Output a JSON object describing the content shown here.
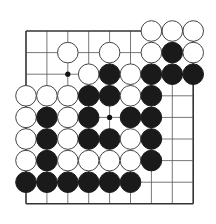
{
  "board": {
    "cols": 9,
    "rows": 9,
    "origin_x": 26,
    "origin_y": 31,
    "spacing_x": 20.9,
    "spacing_y": 21.6,
    "stone_radius": 10.3,
    "colors": {
      "line": "#555555",
      "edge": "#333333",
      "black_stone": "#1a1a1a",
      "white_stone": "#ffffff",
      "white_outline": "#444444",
      "background": "#ffffff"
    },
    "hoshi": [
      [
        2,
        2
      ],
      [
        4,
        4
      ]
    ],
    "stones": [
      {
        "c": 6,
        "r": 0,
        "color": "white"
      },
      {
        "c": 7,
        "r": 0,
        "color": "white"
      },
      {
        "c": 8,
        "r": 0,
        "color": "white"
      },
      {
        "c": 2,
        "r": 1,
        "color": "white"
      },
      {
        "c": 4,
        "r": 1,
        "color": "white"
      },
      {
        "c": 6,
        "r": 1,
        "color": "white"
      },
      {
        "c": 7,
        "r": 1,
        "color": "black"
      },
      {
        "c": 8,
        "r": 1,
        "color": "white"
      },
      {
        "c": 3,
        "r": 2,
        "color": "white"
      },
      {
        "c": 4,
        "r": 2,
        "color": "black"
      },
      {
        "c": 5,
        "r": 2,
        "color": "white"
      },
      {
        "c": 6,
        "r": 2,
        "color": "black"
      },
      {
        "c": 7,
        "r": 2,
        "color": "black"
      },
      {
        "c": 8,
        "r": 2,
        "color": "black"
      },
      {
        "c": 0,
        "r": 3,
        "color": "white"
      },
      {
        "c": 1,
        "r": 3,
        "color": "white"
      },
      {
        "c": 2,
        "r": 3,
        "color": "white"
      },
      {
        "c": 3,
        "r": 3,
        "color": "black"
      },
      {
        "c": 4,
        "r": 3,
        "color": "black"
      },
      {
        "c": 5,
        "r": 3,
        "color": "white"
      },
      {
        "c": 6,
        "r": 3,
        "color": "black"
      },
      {
        "c": 0,
        "r": 4,
        "color": "white"
      },
      {
        "c": 1,
        "r": 4,
        "color": "black"
      },
      {
        "c": 2,
        "r": 4,
        "color": "white"
      },
      {
        "c": 3,
        "r": 4,
        "color": "black"
      },
      {
        "c": 5,
        "r": 4,
        "color": "black"
      },
      {
        "c": 6,
        "r": 4,
        "color": "black"
      },
      {
        "c": 0,
        "r": 5,
        "color": "white"
      },
      {
        "c": 1,
        "r": 5,
        "color": "black"
      },
      {
        "c": 2,
        "r": 5,
        "color": "white"
      },
      {
        "c": 3,
        "r": 5,
        "color": "black"
      },
      {
        "c": 4,
        "r": 5,
        "color": "black"
      },
      {
        "c": 5,
        "r": 5,
        "color": "white"
      },
      {
        "c": 6,
        "r": 5,
        "color": "black"
      },
      {
        "c": 0,
        "r": 6,
        "color": "white"
      },
      {
        "c": 1,
        "r": 6,
        "color": "black"
      },
      {
        "c": 2,
        "r": 6,
        "color": "white"
      },
      {
        "c": 3,
        "r": 6,
        "color": "white"
      },
      {
        "c": 4,
        "r": 6,
        "color": "white"
      },
      {
        "c": 5,
        "r": 6,
        "color": "white"
      },
      {
        "c": 6,
        "r": 6,
        "color": "black"
      },
      {
        "c": 0,
        "r": 7,
        "color": "black"
      },
      {
        "c": 1,
        "r": 7,
        "color": "black"
      },
      {
        "c": 2,
        "r": 7,
        "color": "black"
      },
      {
        "c": 3,
        "r": 7,
        "color": "black"
      },
      {
        "c": 4,
        "r": 7,
        "color": "black"
      },
      {
        "c": 5,
        "r": 7,
        "color": "black"
      }
    ]
  }
}
